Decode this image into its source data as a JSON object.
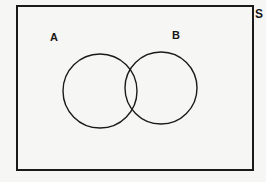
{
  "figure": {
    "kind": "venn-diagram",
    "background_color": "#f6f6f4",
    "stroke_color": "#1a1a1a",
    "fill_color": "none"
  },
  "universe": {
    "label": "S",
    "shape": "rectangle",
    "stroke_width": 2
  },
  "sets": [
    {
      "label": "A",
      "shape": "circle",
      "cx": 100,
      "cy": 91,
      "r": 37,
      "stroke_width": 1.4
    },
    {
      "label": "B",
      "shape": "circle",
      "cx": 161,
      "cy": 88,
      "r": 36,
      "stroke_width": 1.4
    }
  ],
  "regions": {
    "intersection_label": "",
    "shaded": "none"
  }
}
